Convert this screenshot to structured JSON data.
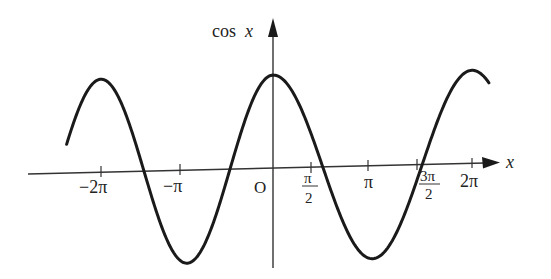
{
  "chart_data": {
    "type": "line",
    "title": "",
    "xlabel": "x",
    "ylabel": "cos x",
    "origin_label": "O",
    "function": "cos(x)",
    "x_range": [
      -2.4,
      2.17
    ],
    "x_range_unit": "pi",
    "ylim": [
      -1,
      1
    ],
    "grid": false,
    "legend": null,
    "x_ticks": [
      {
        "value": "-2pi",
        "label": "−2π",
        "num": -6.2832
      },
      {
        "value": "-pi",
        "label": "−π",
        "num": -3.1416
      },
      {
        "value": "pi/2",
        "label_num": "π",
        "label_den": "2",
        "num": 1.5708
      },
      {
        "value": "pi",
        "label": "π",
        "num": 3.1416
      },
      {
        "value": "3pi/2",
        "label_num": "3π",
        "label_den": "2",
        "num": 4.7124
      },
      {
        "value": "2pi",
        "label": "2π",
        "num": 6.2832
      }
    ],
    "series": [
      {
        "name": "cos x",
        "x": [
          -7.54,
          -6.28,
          -4.71,
          -3.14,
          -1.57,
          0,
          1.57,
          3.14,
          4.71,
          6.28,
          6.82
        ],
        "values": [
          0.31,
          1,
          0,
          -1,
          0,
          1,
          0,
          -1,
          0,
          1,
          0.85
        ]
      }
    ],
    "color": "#1a1a1a"
  }
}
